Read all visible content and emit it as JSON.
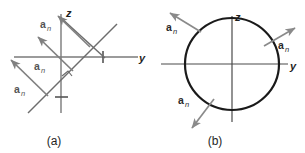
{
  "figure": {
    "background_color": "#ffffff",
    "panels": [
      {
        "id": "panel-a",
        "caption": "(a)",
        "description": "Inclined plane cross-section in the y-z plane with three parallel unit normal vectors",
        "axes": [
          {
            "name": "z-axis",
            "label": "z"
          },
          {
            "name": "y-axis",
            "label": "y"
          }
        ],
        "vectors": [
          {
            "id": "an-top",
            "symbol": "a",
            "subscript": "n"
          },
          {
            "id": "an-middle",
            "symbol": "a",
            "subscript": "n"
          },
          {
            "id": "an-bottom",
            "symbol": "a",
            "subscript": "n"
          }
        ],
        "marks": [
          {
            "name": "y-axis-tick"
          },
          {
            "name": "z-axis-tick"
          },
          {
            "name": "right-angle-marker"
          }
        ]
      },
      {
        "id": "panel-b",
        "caption": "(b)",
        "description": "Circle centered at the origin of the y-z plane with three radial outward unit normal vectors",
        "axes": [
          {
            "name": "z-axis",
            "label": "z"
          },
          {
            "name": "y-axis",
            "label": "y"
          }
        ],
        "vectors": [
          {
            "id": "an-upper-left",
            "symbol": "a",
            "subscript": "n"
          },
          {
            "id": "an-upper-right",
            "symbol": "a",
            "subscript": "n"
          },
          {
            "id": "an-lower-left",
            "symbol": "a",
            "subscript": "n"
          }
        ],
        "shape": {
          "name": "circle",
          "stroke_color": "#1a1a1a"
        }
      }
    ],
    "colors": {
      "axis": "#7a7a7a",
      "vector": "#808080",
      "circle": "#1a1a1a",
      "text": "#2b2b2b"
    }
  }
}
